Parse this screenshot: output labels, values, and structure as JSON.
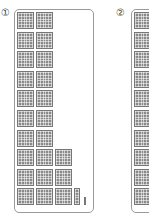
{
  "figure": {
    "panels": [
      {
        "label": "①",
        "description": "Base-ten blocks: hundreds flats, a tens group and a unit",
        "hundreds_columns": [
          10,
          10,
          3
        ],
        "tens_rods": 1,
        "units": 1
      },
      {
        "label": "②",
        "description": "Base-ten blocks column (partially visible)",
        "hundreds_columns": [
          10
        ]
      }
    ]
  },
  "colors": {
    "block": "#8a8a8a",
    "border": "#9a9a9a",
    "label": "#444444"
  }
}
